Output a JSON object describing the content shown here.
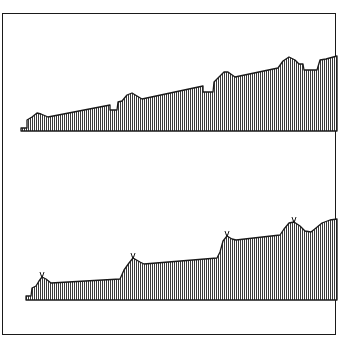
{
  "figure": {
    "colors": {
      "frame": "#1a1a1a",
      "outline": "#1a1a1a",
      "hatch": "#3a3a3a",
      "fill": "#d0d0d0",
      "background": "#ffffff"
    },
    "profiles": [
      {
        "name": "upper-profile",
        "points": "21,131 21,128 27,128 27,120 32,117 37,113 41,114 48,117 110,105 110,110 117,110 118,102 122,101 127,95 132,93 137,96 142,99 203,86 203,92 213,92 214,82 218,78 224,72 228,72 235,77 278,68 283,61 289,57 295,60 299,64 303,64 304,70 317,70 320,60 326,59 337,56 337,131",
        "markers": []
      },
      {
        "name": "lower-profile",
        "points": "26,300 26,296 31,296 32,288 36,286 39,281 42,277 46,279 51,283 120,279 124,270 129,263 133,258 140,262 144,264 217,258 220,252 223,241 227,236 232,239 236,240 280,235 284,229 289,223 294,222 300,226 305,231 311,232 316,228 322,223 330,220 337,219 337,300",
        "markers": [
          {
            "x": 42,
            "y": 276
          },
          {
            "x": 133,
            "y": 257
          },
          {
            "x": 227,
            "y": 235
          },
          {
            "x": 294,
            "y": 221
          }
        ]
      }
    ]
  }
}
